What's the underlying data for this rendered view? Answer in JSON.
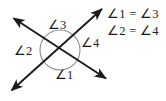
{
  "figure": {
    "type": "geometry-diagram",
    "background_color": "#ffffff",
    "stroke_color": "#1a1a1a",
    "arc_color": "#777777"
  },
  "diagram": {
    "intersection": {
      "x": 60,
      "y": 50
    },
    "circle": {
      "cx": 60,
      "cy": 50,
      "r": 20
    },
    "lines": [
      {
        "name": "line-a",
        "from": {
          "x": 12,
          "y": 17
        },
        "to": {
          "x": 108,
          "y": 80
        },
        "arrow_start": true,
        "arrow_end": true
      },
      {
        "name": "line-b",
        "from": {
          "x": 10,
          "y": 92
        },
        "to": {
          "x": 104,
          "y": 7
        },
        "arrow_start": true,
        "arrow_end": true
      }
    ],
    "angle_labels": [
      {
        "id": "angle-3",
        "text": "∠3",
        "x": 57,
        "y": 25,
        "position": "top"
      },
      {
        "id": "angle-2",
        "text": "∠2",
        "x": 23,
        "y": 50,
        "position": "left"
      },
      {
        "id": "angle-4",
        "text": "∠4",
        "x": 88,
        "y": 43,
        "position": "right"
      },
      {
        "id": "angle-1",
        "text": "∠1",
        "x": 63,
        "y": 75,
        "position": "bottom"
      }
    ]
  },
  "equations": {
    "line_1": "∠1 = ∠3",
    "line_2": "∠2 = ∠4"
  }
}
